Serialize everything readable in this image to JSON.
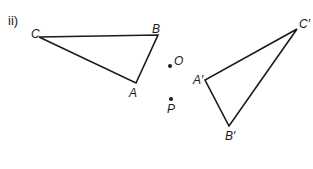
{
  "part_label": "ii)",
  "colors": {
    "ink": "#1a1a1a",
    "background": "#ffffff"
  },
  "triangle_original": {
    "vertices": [
      {
        "name": "C",
        "x": 39,
        "y": 37
      },
      {
        "name": "B",
        "x": 158,
        "y": 35
      },
      {
        "name": "A",
        "x": 136,
        "y": 83
      }
    ],
    "labels": {
      "C": "C",
      "B": "B",
      "A": "A"
    }
  },
  "triangle_image": {
    "vertices": [
      {
        "name": "C'",
        "x": 297,
        "y": 29
      },
      {
        "name": "A'",
        "x": 205,
        "y": 80
      },
      {
        "name": "B'",
        "x": 229,
        "y": 126
      }
    ],
    "labels": {
      "C": "C′",
      "A": "A′",
      "B": "B′"
    }
  },
  "points": {
    "O": {
      "label": "O",
      "x": 170,
      "y": 66
    },
    "P": {
      "label": "P",
      "x": 171,
      "y": 99
    }
  }
}
